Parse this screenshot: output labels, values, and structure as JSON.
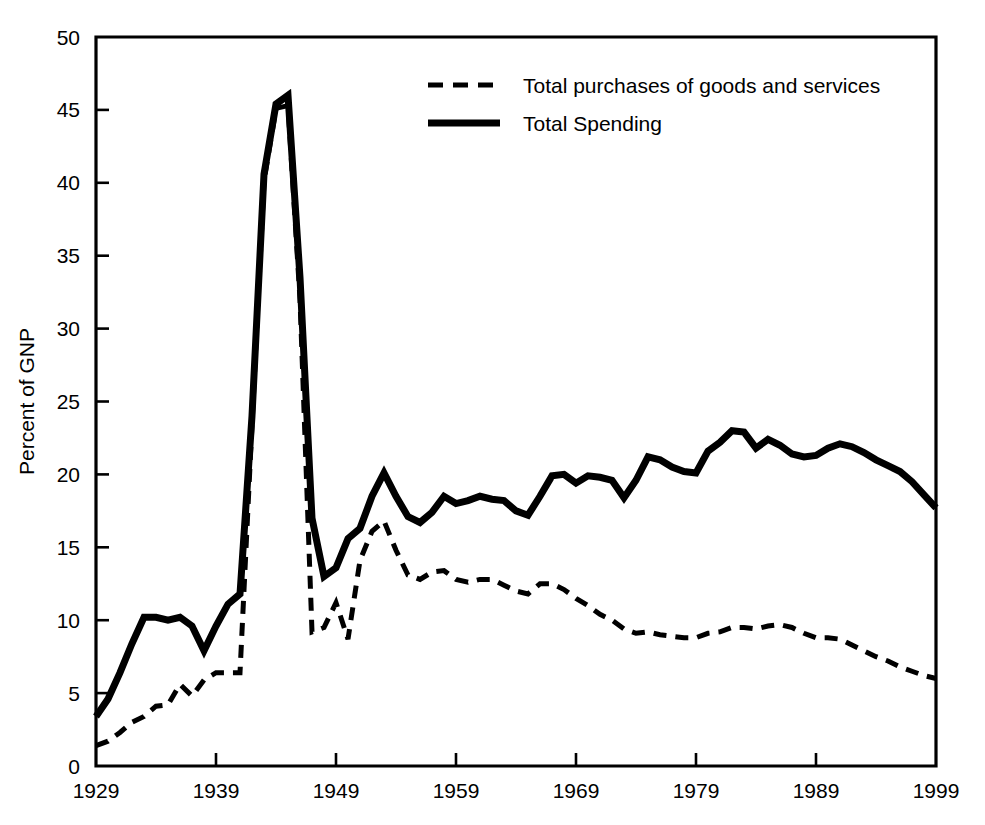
{
  "chart_data": {
    "type": "line",
    "title": "",
    "xlabel": "",
    "ylabel": "Percent of GNP",
    "xlim": [
      1929,
      1999
    ],
    "ylim": [
      0,
      50
    ],
    "grid": false,
    "legend_position": "top-center",
    "x_tick_labels": [
      "1929",
      "1939",
      "1949",
      "1959",
      "1969",
      "1979",
      "1989",
      "1999"
    ],
    "x_ticks": [
      1929,
      1939,
      1949,
      1959,
      1969,
      1979,
      1989,
      1999
    ],
    "y_tick_labels": [
      "0",
      "5",
      "10",
      "15",
      "20",
      "25",
      "30",
      "35",
      "40",
      "45",
      "50"
    ],
    "y_ticks": [
      0,
      5,
      10,
      15,
      20,
      25,
      30,
      35,
      40,
      45,
      50
    ],
    "x": [
      1929,
      1930,
      1931,
      1932,
      1933,
      1934,
      1935,
      1936,
      1937,
      1938,
      1939,
      1940,
      1941,
      1942,
      1943,
      1944,
      1945,
      1946,
      1947,
      1948,
      1949,
      1950,
      1951,
      1952,
      1953,
      1954,
      1955,
      1956,
      1957,
      1958,
      1959,
      1960,
      1961,
      1962,
      1963,
      1964,
      1965,
      1966,
      1967,
      1968,
      1969,
      1970,
      1971,
      1972,
      1973,
      1974,
      1975,
      1976,
      1977,
      1978,
      1979,
      1980,
      1981,
      1982,
      1983,
      1984,
      1985,
      1986,
      1987,
      1988,
      1989,
      1990,
      1991,
      1992,
      1993,
      1994,
      1995,
      1996,
      1997,
      1998,
      1999
    ],
    "series": [
      {
        "name": "Total Spending",
        "style": "solid",
        "linewidth": 7,
        "color": "#000000",
        "values": [
          3.4,
          4.6,
          6.4,
          8.4,
          10.2,
          10.2,
          10.0,
          10.2,
          9.6,
          7.9,
          9.6,
          11.1,
          11.8,
          24.0,
          40.6,
          45.4,
          46.0,
          33.5,
          17.0,
          13.0,
          13.6,
          15.6,
          16.3,
          18.5,
          20.1,
          18.5,
          17.1,
          16.7,
          17.4,
          18.5,
          18.0,
          18.2,
          18.5,
          18.3,
          18.2,
          17.5,
          17.2,
          18.5,
          19.9,
          20.0,
          19.4,
          19.9,
          19.8,
          19.6,
          18.4,
          19.6,
          21.2,
          21.0,
          20.5,
          20.2,
          20.1,
          21.6,
          22.2,
          23.0,
          22.9,
          21.8,
          22.4,
          22.0,
          21.4,
          21.2,
          21.3,
          21.8,
          22.1,
          21.9,
          21.5,
          21.0,
          20.6,
          20.2,
          19.5,
          18.6,
          17.7
        ]
      },
      {
        "name": "Total purchases of goods and services",
        "style": "dashed",
        "linewidth": 5,
        "color": "#000000",
        "values": [
          1.4,
          1.7,
          2.3,
          3.0,
          3.4,
          4.1,
          4.2,
          5.6,
          4.8,
          5.9,
          6.4,
          6.4,
          6.4,
          23.4,
          40.1,
          45.1,
          45.3,
          32.0,
          9.2,
          9.5,
          11.2,
          8.7,
          14.1,
          16.1,
          16.8,
          14.8,
          13.1,
          12.8,
          13.3,
          13.4,
          12.8,
          12.6,
          12.8,
          12.8,
          12.4,
          12.0,
          11.8,
          12.5,
          12.5,
          12.1,
          11.5,
          11.0,
          10.4,
          10.0,
          9.4,
          9.1,
          9.2,
          9.0,
          8.9,
          8.8,
          8.8,
          9.1,
          9.2,
          9.5,
          9.5,
          9.4,
          9.6,
          9.7,
          9.5,
          9.1,
          8.8,
          8.8,
          8.7,
          8.3,
          7.9,
          7.5,
          7.2,
          6.8,
          6.5,
          6.2,
          6.0
        ]
      }
    ],
    "legend": [
      {
        "label": "Total purchases of goods and services",
        "style": "dashed"
      },
      {
        "label": "Total Spending",
        "style": "solid"
      }
    ]
  }
}
